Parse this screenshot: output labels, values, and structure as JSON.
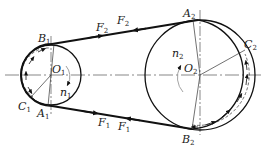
{
  "colors": {
    "ink": "#1a1a1a",
    "belt": "#111111",
    "thin": "#333333",
    "centerline": "#555555"
  },
  "labels": {
    "B1": {
      "main": "B",
      "sub": "1"
    },
    "A1": {
      "main": "A",
      "sub": "1"
    },
    "C1": {
      "main": "C",
      "sub": "1"
    },
    "O1": {
      "main": "O",
      "sub": "1"
    },
    "n1": {
      "main": "n",
      "sub": "1"
    },
    "A2": {
      "main": "A",
      "sub": "2"
    },
    "B2": {
      "main": "B",
      "sub": "2"
    },
    "C2": {
      "main": "C",
      "sub": "2"
    },
    "O2": {
      "main": "O",
      "sub": "2"
    },
    "n2": {
      "main": "n",
      "sub": "2"
    },
    "F2a": {
      "main": "F",
      "sub": "2"
    },
    "F2b": {
      "main": "F",
      "sub": "2"
    },
    "F1a": {
      "main": "F",
      "sub": "1"
    },
    "F1b": {
      "main": "F",
      "sub": "1"
    }
  },
  "pulleys": [
    {
      "name": "driving-pulley",
      "center": "O1",
      "speed": "n1"
    },
    {
      "name": "driven-pulley",
      "center": "O2",
      "speed": "n2"
    }
  ],
  "belt_spans": [
    {
      "name": "tight-side",
      "from": "B1",
      "to": "A2",
      "forces": [
        "F2",
        "F2"
      ]
    },
    {
      "name": "slack-side",
      "from": "A1",
      "to": "B2",
      "forces": [
        "F1",
        "F1"
      ]
    }
  ]
}
